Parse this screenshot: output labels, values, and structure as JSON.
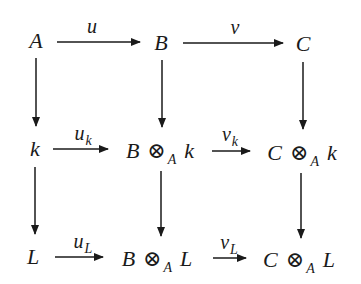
{
  "diagram": {
    "colors": {
      "ink": "#1a1a1a",
      "background": "#ffffff"
    },
    "nodes": {
      "r0c0": {
        "main": "A"
      },
      "r0c1": {
        "main": "B"
      },
      "r0c2": {
        "main": "C"
      },
      "r1c0": {
        "main": "k"
      },
      "r1c1": {
        "left": "B",
        "op": "⊗",
        "sub": "A",
        "right": "k"
      },
      "r1c2": {
        "left": "C",
        "op": "⊗",
        "sub": "A",
        "right": "k"
      },
      "r2c0": {
        "main": "L"
      },
      "r2c1": {
        "left": "B",
        "op": "⊗",
        "sub": "A",
        "right": "L"
      },
      "r2c2": {
        "left": "C",
        "op": "⊗",
        "sub": "A",
        "right": "L"
      }
    },
    "edges": {
      "top_left": {
        "from": "A",
        "to": "B",
        "label": "u",
        "label_sub": ""
      },
      "top_right": {
        "from": "B",
        "to": "C",
        "label": "v",
        "label_sub": ""
      },
      "mid_left": {
        "from": "k",
        "to": "B ⊗_A k",
        "label": "u",
        "label_sub": "k"
      },
      "mid_right": {
        "from": "B ⊗_A k",
        "to": "C ⊗_A k",
        "label": "v",
        "label_sub": "k"
      },
      "bot_left": {
        "from": "L",
        "to": "B ⊗_A L",
        "label": "u",
        "label_sub": "L"
      },
      "bot_right": {
        "from": "B ⊗_A L",
        "to": "C ⊗_A L",
        "label": "v",
        "label_sub": "L"
      },
      "v_col0_top": {
        "from": "A",
        "to": "k"
      },
      "v_col0_bot": {
        "from": "k",
        "to": "L"
      },
      "v_col1_top": {
        "from": "B",
        "to": "B ⊗_A k"
      },
      "v_col1_bot": {
        "from": "B ⊗_A k",
        "to": "B ⊗_A L"
      },
      "v_col2_top": {
        "from": "C",
        "to": "C ⊗_A k"
      },
      "v_col2_bot": {
        "from": "C ⊗_A k",
        "to": "C ⊗_A L"
      }
    }
  }
}
